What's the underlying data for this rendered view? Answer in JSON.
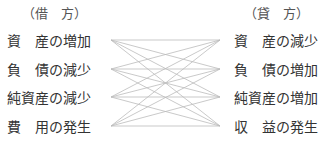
{
  "debit": {
    "header": "（借　方）",
    "items": [
      "資　産の増加",
      "負　債の減少",
      "純資産の減少",
      "費　用の発生"
    ]
  },
  "credit": {
    "header": "（貸　方）",
    "items": [
      "資　産の減少",
      "負　債の増加",
      "純資産の増加",
      "収　益の発生"
    ]
  },
  "connections": "every debit item connects to every credit item",
  "line_color": "#bbbbbb"
}
